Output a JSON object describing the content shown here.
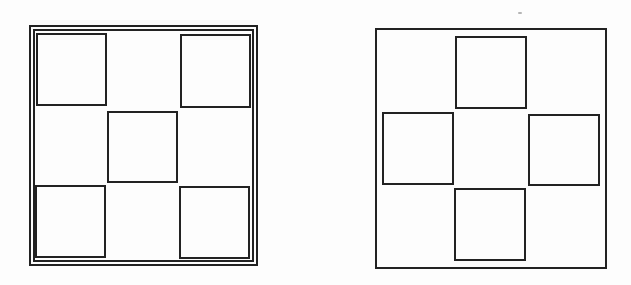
{
  "figures": [
    {
      "id": "figure-left",
      "description": "Square frame with double border containing five squares in an X (quincunx) arrangement",
      "outer_frame": {
        "x": 29,
        "y": 25,
        "w": 229,
        "h": 241
      },
      "inner_frame": {
        "x": 33,
        "y": 29,
        "w": 221,
        "h": 233
      },
      "squares": [
        {
          "name": "top-left",
          "x": 36,
          "y": 33,
          "w": 71,
          "h": 73
        },
        {
          "name": "top-right",
          "x": 180,
          "y": 34,
          "w": 71,
          "h": 74
        },
        {
          "name": "center",
          "x": 107,
          "y": 111,
          "w": 71,
          "h": 72
        },
        {
          "name": "bottom-left",
          "x": 35,
          "y": 185,
          "w": 71,
          "h": 73
        },
        {
          "name": "bottom-right",
          "x": 179,
          "y": 186,
          "w": 71,
          "h": 73
        }
      ]
    },
    {
      "id": "figure-right",
      "description": "Square frame with single border containing four squares in a plus (cross) arrangement",
      "outer_frame": {
        "x": 375,
        "y": 28,
        "w": 232,
        "h": 241
      },
      "squares": [
        {
          "name": "top",
          "x": 455,
          "y": 36,
          "w": 72,
          "h": 73
        },
        {
          "name": "left",
          "x": 382,
          "y": 112,
          "w": 72,
          "h": 73
        },
        {
          "name": "right",
          "x": 528,
          "y": 114,
          "w": 72,
          "h": 72
        },
        {
          "name": "bottom",
          "x": 454,
          "y": 188,
          "w": 72,
          "h": 73
        }
      ]
    }
  ],
  "colors": {
    "stroke": "#222222",
    "background": "#ffffff"
  }
}
